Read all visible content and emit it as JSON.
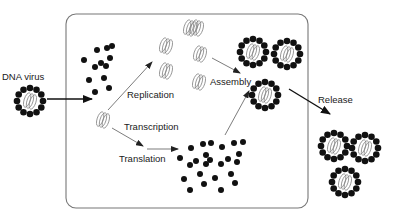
{
  "diagram": {
    "labels": {
      "dna_virus": "DNA virus",
      "replication": "Replication",
      "transcription": "Transcription",
      "translation": "Translation",
      "assembly": "Assembly",
      "release": "Release"
    },
    "colors": {
      "dots": "#111111",
      "cell_border": "#777777",
      "dna_coil": "#888888",
      "text": "#1a1a1a"
    },
    "nodes": [
      {
        "id": "entering-virion",
        "label": "DNA virus",
        "location": "outside cell, left"
      },
      {
        "id": "capsid-proteins-uncoated",
        "location": "inside cell, upper left"
      },
      {
        "id": "viral-dna-genome",
        "location": "inside cell, left center"
      },
      {
        "id": "replicated-genomes",
        "count": 6,
        "location": "inside cell, top center"
      },
      {
        "id": "translated-proteins",
        "location": "inside cell, bottom center"
      },
      {
        "id": "assembled-virions",
        "count": 3,
        "location": "inside cell, right"
      },
      {
        "id": "released-virions",
        "count": 3,
        "location": "outside cell, right"
      }
    ],
    "edges": [
      {
        "from": "entering-virion",
        "to": "capsid-proteins-uncoated",
        "style": "thick"
      },
      {
        "from": "viral-dna-genome",
        "to": "replicated-genomes",
        "label": "Replication"
      },
      {
        "from": "viral-dna-genome",
        "to": "translated-proteins",
        "label": "Transcription / Translation"
      },
      {
        "from": "replicated-genomes",
        "to": "assembled-virions",
        "label": "Assembly"
      },
      {
        "from": "translated-proteins",
        "to": "assembled-virions"
      },
      {
        "from": "assembled-virions",
        "to": "released-virions",
        "label": "Release",
        "style": "thick"
      }
    ]
  }
}
